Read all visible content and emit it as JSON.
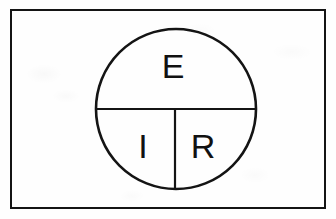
{
  "figure": {
    "colors": {
      "ink": "#141414",
      "background": "#ffffff"
    },
    "border": {
      "name": "outer rectangle",
      "x": 11,
      "y": 10,
      "width": 314,
      "height": 198,
      "stroke_width": 2
    },
    "circle": {
      "name": "ohms law circle",
      "center_x": 176,
      "center_y": 109,
      "radius": 80,
      "stroke_width": 2.6
    },
    "divider_horizontal": {
      "name": "horizontal diameter",
      "x1": 96,
      "y1": 109,
      "x2": 256,
      "y2": 109,
      "stroke_width": 2.2
    },
    "divider_vertical": {
      "name": "vertical radius",
      "x1": 175,
      "y1": 109,
      "x2": 175,
      "y2": 189,
      "stroke_width": 2.2
    },
    "labels": [
      {
        "key": "top",
        "text": "E",
        "meaning": "voltage",
        "x": 173,
        "y": 78,
        "font_size": 34
      },
      {
        "key": "bottom_left",
        "text": "I",
        "meaning": "current",
        "x": 143,
        "y": 158,
        "font_size": 34
      },
      {
        "key": "bottom_right",
        "text": "R",
        "meaning": "resistance",
        "x": 203,
        "y": 158,
        "font_size": 34
      }
    ]
  }
}
